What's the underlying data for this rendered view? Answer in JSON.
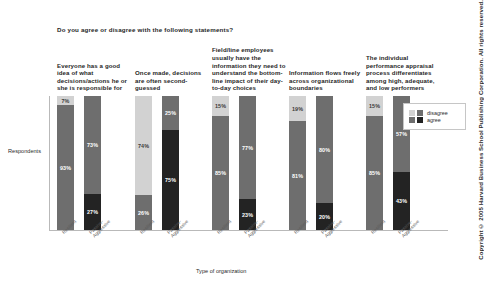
{
  "question": "Do you agree or disagree with the following statements?",
  "copyright": "Copyright © 2005 Harvard Business School Publishing Corporation. All rights reserved.",
  "axes": {
    "ylabel": "Respondents",
    "xlabel": "Type of organization"
  },
  "legend": {
    "position": "right",
    "items": [
      {
        "label": "disagree",
        "swatches": [
          "#d2d2d2",
          "#6e6e6e"
        ]
      },
      {
        "label": "agree",
        "swatches": [
          "#6e6e6e",
          "#232323"
        ]
      }
    ]
  },
  "colors": {
    "disagree_resilient": "#d2d2d2",
    "agree_resilient": "#6e6e6e",
    "disagree_passive": "#6e6e6e",
    "agree_passive": "#232323",
    "axis": "#b9b9b9"
  },
  "chart_data": {
    "type": "bar",
    "title": "Do you agree or disagree with the following statements?",
    "xlabel": "Type of organization",
    "ylabel": "Respondents",
    "ylim": [
      0,
      100
    ],
    "stacked": true,
    "grid": false,
    "legend": [
      "disagree",
      "agree"
    ],
    "categories": [
      "Resilient",
      "Passive-Aggressive"
    ],
    "groups": [
      {
        "statement": "Everyone has a good idea of what decisions/actions he or she is responsible for",
        "bars": [
          {
            "org": "Resilient",
            "disagree": 7,
            "agree": 93,
            "disagree_label": "7%",
            "agree_label": "93%"
          },
          {
            "org": "Passive-Aggressive",
            "disagree": 73,
            "agree": 27,
            "disagree_label": "73%",
            "agree_label": "27%"
          }
        ]
      },
      {
        "statement": "Once made, decisions are often second-guessed",
        "bars": [
          {
            "org": "Resilient",
            "disagree": 74,
            "agree": 26,
            "disagree_label": "74%",
            "agree_label": "26%"
          },
          {
            "org": "Passive-Aggressive",
            "disagree": 25,
            "agree": 75,
            "disagree_label": "25%",
            "agree_label": "75%"
          }
        ]
      },
      {
        "statement": "Field/line employees usually have the information they need to understand the bottom-line impact of their day-to-day choices",
        "bars": [
          {
            "org": "Resilient",
            "disagree": 15,
            "agree": 85,
            "disagree_label": "15%",
            "agree_label": "85%"
          },
          {
            "org": "Passive-Aggressive",
            "disagree": 77,
            "agree": 23,
            "disagree_label": "77%",
            "agree_label": "23%"
          }
        ]
      },
      {
        "statement": "Information flows freely across organizational boundaries",
        "bars": [
          {
            "org": "Resilient",
            "disagree": 19,
            "agree": 81,
            "disagree_label": "19%",
            "agree_label": "81%"
          },
          {
            "org": "Passive-Aggressive",
            "disagree": 80,
            "agree": 20,
            "disagree_label": "80%",
            "agree_label": "20%"
          }
        ]
      },
      {
        "statement": "The individual performance appraisal process differentiates among high, adequate, and low performers",
        "bars": [
          {
            "org": "Resilient",
            "disagree": 15,
            "agree": 85,
            "disagree_label": "15%",
            "agree_label": "85%"
          },
          {
            "org": "Passive-Aggressive",
            "disagree": 57,
            "agree": 43,
            "disagree_label": "57%",
            "agree_label": "43%"
          }
        ]
      }
    ]
  }
}
